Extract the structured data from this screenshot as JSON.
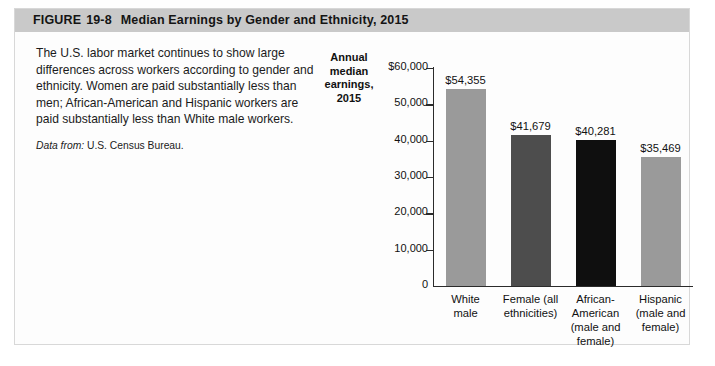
{
  "figure": {
    "label": "FIGURE",
    "number": "19-8",
    "title": "Median Earnings by Gender and Ethnicity, 2015"
  },
  "caption": {
    "body": "The U.S. labor market continues to show large differences across workers according to gender and ethnicity. Women are paid substantially less than men; African-American and Hispanic workers are paid substantially less than White male workers.",
    "source_label": "Data from:",
    "source_value": "U.S. Census Bureau."
  },
  "chart_data": {
    "type": "bar",
    "title": "Median Earnings by Gender and Ethnicity, 2015",
    "xlabel": "",
    "ylabel": "Annual median earnings, 2015",
    "ylabel_lines": [
      "Annual",
      "median",
      "earnings,",
      "2015"
    ],
    "categories": [
      "White male",
      "Female (all ethnicities)",
      "African-American (male and female)",
      "Hispanic (male and female)"
    ],
    "category_lines": [
      [
        "White",
        "male"
      ],
      [
        "Female (all",
        "ethnicities)"
      ],
      [
        "African-",
        "American",
        "(male and",
        "female)"
      ],
      [
        "Hispanic",
        "(male and",
        "female)"
      ]
    ],
    "values": [
      54355,
      41679,
      40281,
      35469
    ],
    "value_labels": [
      "$54,355",
      "$41,679",
      "$40,281",
      "$35,469"
    ],
    "bar_colors": [
      "#9a9a9a",
      "#4d4d4d",
      "#0f0f0f",
      "#9a9a9a"
    ],
    "ylim": [
      0,
      60000
    ],
    "yticks": [
      60000,
      50000,
      40000,
      30000,
      20000,
      10000,
      0
    ],
    "ytick_labels": [
      "$60,000",
      "50,000",
      "40,000",
      "30,000",
      "20,000",
      "10,000",
      "0"
    ],
    "grid": false,
    "legend": false
  },
  "colors": {
    "header_band": "#c9c9c9",
    "panel_background": "#fdfdfd",
    "panel_border": "#d8d8d8",
    "axis": "#2b2b2b",
    "text": "#111111"
  }
}
